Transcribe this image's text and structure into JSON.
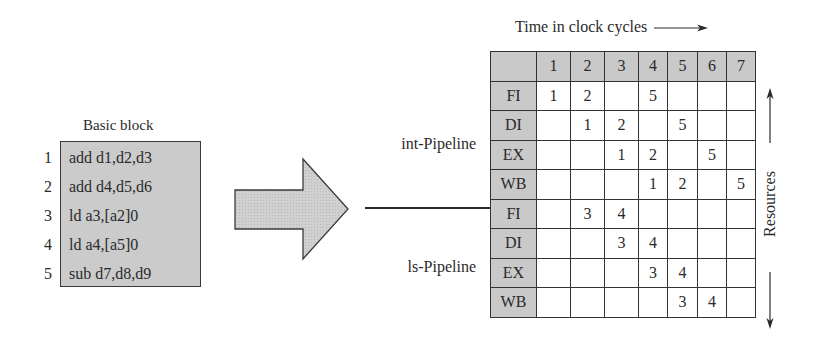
{
  "basic_block": {
    "title": "Basic block",
    "instructions": [
      {
        "num": "1",
        "text": "add d1,d2,d3"
      },
      {
        "num": "2",
        "text": "add d4,d5,d6"
      },
      {
        "num": "3",
        "text": "ld a3,[a2]0"
      },
      {
        "num": "4",
        "text": "ld a4,[a5]0"
      },
      {
        "num": "5",
        "text": "sub d7,d8,d9"
      }
    ]
  },
  "arrow": {
    "icon": "block-right-arrow-icon"
  },
  "pipelines": {
    "int_label": "int-Pipeline",
    "ls_label": "ls-Pipeline"
  },
  "axis": {
    "time_label": "Time in clock cycles",
    "time_arrow": "→",
    "resources_label": "Resources"
  },
  "table": {
    "columns": [
      "",
      "1",
      "2",
      "3",
      "4",
      "5",
      "6",
      "7"
    ],
    "column_widths": [
      46,
      34,
      34,
      34,
      29,
      30,
      29,
      29
    ],
    "rows": [
      {
        "stage": "FI",
        "cells": [
          "1",
          "2",
          "",
          "5",
          "",
          "",
          ""
        ]
      },
      {
        "stage": "DI",
        "cells": [
          "",
          "1",
          "2",
          "",
          "5",
          "",
          ""
        ]
      },
      {
        "stage": "EX",
        "cells": [
          "",
          "",
          "1",
          "2",
          "",
          "5",
          ""
        ]
      },
      {
        "stage": "WB",
        "cells": [
          "",
          "",
          "",
          "1",
          "2",
          "",
          "5"
        ]
      },
      {
        "stage": "FI",
        "cells": [
          "",
          "3",
          "4",
          "",
          "",
          "",
          ""
        ]
      },
      {
        "stage": "DI",
        "cells": [
          "",
          "",
          "3",
          "4",
          "",
          "",
          ""
        ]
      },
      {
        "stage": "EX",
        "cells": [
          "",
          "",
          "",
          "3",
          "4",
          "",
          ""
        ]
      },
      {
        "stage": "WB",
        "cells": [
          "",
          "",
          "",
          "",
          "3",
          "4",
          ""
        ]
      }
    ]
  },
  "colors": {
    "fill_gray": "#c9c9c9",
    "line": "#2a2a2a"
  }
}
